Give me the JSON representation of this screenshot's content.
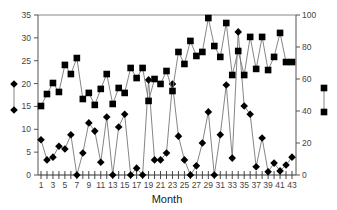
{
  "chart_data": {
    "type": "line",
    "title": "",
    "xlabel": "Month",
    "ylabel_left": "",
    "ylabel_right": "",
    "x": [
      1,
      2,
      3,
      4,
      5,
      6,
      7,
      8,
      9,
      10,
      11,
      12,
      13,
      14,
      15,
      16,
      17,
      18,
      19,
      20,
      21,
      22,
      23,
      24,
      25,
      26,
      27,
      28,
      29,
      30,
      31,
      32,
      33,
      34,
      35,
      36,
      37,
      38,
      39,
      40,
      41,
      42,
      43
    ],
    "x_tick_labels": [
      "1",
      "3",
      "5",
      "7",
      "9",
      "11",
      "13",
      "15",
      "17",
      "19",
      "21",
      "23",
      "25",
      "27",
      "29",
      "31",
      "33",
      "35",
      "37",
      "39",
      "41",
      "43"
    ],
    "ylim_left": [
      0,
      35
    ],
    "yticks_left": [
      0,
      5,
      10,
      15,
      20,
      25,
      30,
      35
    ],
    "ylim_right": [
      0,
      100
    ],
    "yticks_right": [
      0,
      20,
      40,
      60,
      80,
      100
    ],
    "grid": false,
    "series": [
      {
        "name": "diamond series",
        "axis": "left",
        "marker": "diamond",
        "legend_position": "left",
        "values": [
          7.7,
          3.3,
          3.9,
          6.3,
          5.7,
          8.8,
          0,
          4.8,
          11.4,
          9.6,
          2.8,
          12.7,
          0,
          10.5,
          13.3,
          0,
          1.5,
          0,
          20.8,
          3.3,
          3.3,
          4.8,
          19.9,
          8.5,
          3.3,
          0,
          2.0,
          7.0,
          13.8,
          0,
          8.8,
          19.7,
          3.7,
          31.3,
          15.1,
          13.3,
          1.8,
          8.1,
          0.7,
          2.6,
          0.9,
          2.2,
          3.9
        ]
      },
      {
        "name": "square series",
        "axis": "right",
        "marker": "square",
        "legend_position": "right",
        "values": [
          43.1,
          50.6,
          57.5,
          51.9,
          68.8,
          63.1,
          73.1,
          47.5,
          51.3,
          43.8,
          53.8,
          63.1,
          44.4,
          54.4,
          51.3,
          66.9,
          60.6,
          66.9,
          46.3,
          60.0,
          56.9,
          65.0,
          52.5,
          76.9,
          69.4,
          83.8,
          74.4,
          76.9,
          98.1,
          80.6,
          73.8,
          95.0,
          62.5,
          77.5,
          62.5,
          86.3,
          66.3,
          86.3,
          65.6,
          73.8,
          88.8,
          70.6,
          70.6
        ]
      }
    ]
  }
}
